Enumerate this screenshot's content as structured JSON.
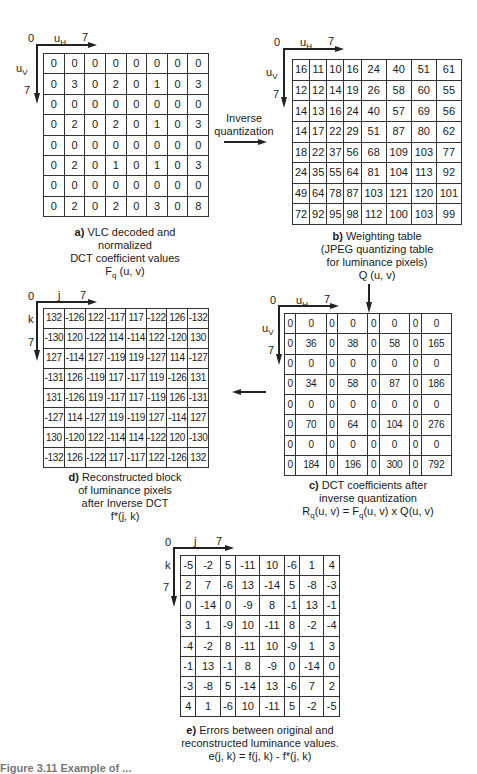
{
  "panels": {
    "a": {
      "axis": {
        "origin": "0",
        "h_label": "u",
        "h_sub": "H",
        "h_max": "7",
        "v_label": "u",
        "v_sub": "V",
        "v_max": "7"
      },
      "caption_label": "a)",
      "caption_lines": [
        "VLC decoded and",
        "normalized",
        "DCT coefficient values",
        "F"
      ],
      "caption_sub": "q",
      "caption_tail": "(u, v)",
      "matrix": [
        [
          "0",
          "0",
          "0",
          "0",
          "0",
          "0",
          "0",
          "0"
        ],
        [
          "0",
          "3",
          "0",
          "2",
          "0",
          "1",
          "0",
          "3"
        ],
        [
          "0",
          "0",
          "0",
          "0",
          "0",
          "0",
          "0",
          "0"
        ],
        [
          "0",
          "2",
          "0",
          "2",
          "0",
          "1",
          "0",
          "3"
        ],
        [
          "0",
          "0",
          "0",
          "0",
          "0",
          "0",
          "0",
          "0"
        ],
        [
          "0",
          "2",
          "0",
          "1",
          "0",
          "1",
          "0",
          "3"
        ],
        [
          "0",
          "0",
          "0",
          "0",
          "0",
          "0",
          "0",
          "0"
        ],
        [
          "0",
          "2",
          "0",
          "2",
          "0",
          "3",
          "0",
          "8"
        ]
      ]
    },
    "b": {
      "axis": {
        "origin": "0",
        "h_label": "u",
        "h_sub": "H",
        "h_max": "7",
        "v_label": "u",
        "v_sub": "V",
        "v_max": "7"
      },
      "caption_label": "b)",
      "caption_lines": [
        "Weighting table",
        "(JPEG quantizing table",
        "for luminance pixels)",
        "Q (u, v)"
      ],
      "matrix": [
        [
          "16",
          "11",
          "10",
          "16",
          "24",
          "40",
          "51",
          "61"
        ],
        [
          "12",
          "12",
          "14",
          "19",
          "26",
          "58",
          "60",
          "55"
        ],
        [
          "14",
          "13",
          "16",
          "24",
          "40",
          "57",
          "69",
          "56"
        ],
        [
          "14",
          "17",
          "22",
          "29",
          "51",
          "87",
          "80",
          "62"
        ],
        [
          "18",
          "22",
          "37",
          "56",
          "68",
          "109",
          "103",
          "77"
        ],
        [
          "24",
          "35",
          "55",
          "64",
          "81",
          "104",
          "113",
          "92"
        ],
        [
          "49",
          "64",
          "78",
          "87",
          "103",
          "121",
          "120",
          "101"
        ],
        [
          "72",
          "92",
          "95",
          "98",
          "112",
          "100",
          "103",
          "99"
        ]
      ]
    },
    "c": {
      "axis": {
        "origin": "0",
        "h_label": "u",
        "h_sub": "H",
        "h_max": "7",
        "v_label": "u",
        "v_sub": "V",
        "v_max": "7"
      },
      "caption_label": "c)",
      "caption_lines": [
        "DCT coefficients after",
        "inverse quantization"
      ],
      "caption_formula": {
        "r": "R",
        "r_sub": "q",
        "mid": "(u, v) = F",
        "f_sub": "q",
        "tail": "(u, v) x Q(u, v)"
      },
      "matrix": [
        [
          "0",
          "0",
          "0",
          "0",
          "0",
          "0",
          "0",
          "0"
        ],
        [
          "0",
          "36",
          "0",
          "38",
          "0",
          "58",
          "0",
          "165"
        ],
        [
          "0",
          "0",
          "0",
          "0",
          "0",
          "0",
          "0",
          "0"
        ],
        [
          "0",
          "34",
          "0",
          "58",
          "0",
          "87",
          "0",
          "186"
        ],
        [
          "0",
          "0",
          "0",
          "0",
          "0",
          "0",
          "0",
          "0"
        ],
        [
          "0",
          "70",
          "0",
          "64",
          "0",
          "104",
          "0",
          "276"
        ],
        [
          "0",
          "0",
          "0",
          "0",
          "0",
          "0",
          "0",
          "0"
        ],
        [
          "0",
          "184",
          "0",
          "196",
          "0",
          "300",
          "0",
          "792"
        ]
      ]
    },
    "d": {
      "axis": {
        "origin": "0",
        "h_label": "j",
        "h_max": "7",
        "v_label": "k",
        "v_max": "7"
      },
      "caption_label": "d)",
      "caption_lines": [
        "Reconstructed block",
        "of luminance pixels",
        "after Inverse DCT",
        "f*(j, k)"
      ],
      "matrix": [
        [
          "132",
          "-126",
          "122",
          "-117",
          "117",
          "-122",
          "126",
          "-132"
        ],
        [
          "-130",
          "120",
          "-122",
          "114",
          "-114",
          "122",
          "-120",
          "130"
        ],
        [
          "127",
          "-114",
          "127",
          "-119",
          "119",
          "-127",
          "114",
          "-127"
        ],
        [
          "-131",
          "126",
          "-119",
          "117",
          "-117",
          "119",
          "-126",
          "131"
        ],
        [
          "131",
          "-126",
          "119",
          "-117",
          "117",
          "-119",
          "126",
          "-131"
        ],
        [
          "-127",
          "114",
          "-127",
          "119",
          "-119",
          "127",
          "-114",
          "127"
        ],
        [
          "130",
          "-120",
          "122",
          "-114",
          "114",
          "-122",
          "120",
          "-130"
        ],
        [
          "-132",
          "126",
          "-122",
          "117",
          "-117",
          "122",
          "-126",
          "132"
        ]
      ]
    },
    "e": {
      "axis": {
        "origin": "0",
        "h_label": "j",
        "h_max": "7",
        "v_label": "k",
        "v_max": "7"
      },
      "caption_label": "e)",
      "caption_lines": [
        "Errors between original and",
        "reconstructed luminance values.",
        "e(j, k) = f(j, k) - f*(j, k)"
      ],
      "matrix": [
        [
          "-5",
          "-2",
          "5",
          "-11",
          "10",
          "-6",
          "1",
          "4"
        ],
        [
          "2",
          "7",
          "-6",
          "13",
          "-14",
          "5",
          "-8",
          "-3"
        ],
        [
          "0",
          "-14",
          "0",
          "-9",
          "8",
          "-1",
          "13",
          "-1"
        ],
        [
          "3",
          "1",
          "-9",
          "10",
          "-11",
          "8",
          "-2",
          "-4"
        ],
        [
          "-4",
          "-2",
          "8",
          "-11",
          "10",
          "-9",
          "1",
          "3"
        ],
        [
          "-1",
          "13",
          "-1",
          "8",
          "-9",
          "0",
          "-14",
          "0"
        ],
        [
          "-3",
          "-8",
          "5",
          "-14",
          "13",
          "-6",
          "7",
          "2"
        ],
        [
          "4",
          "1",
          "-6",
          "10",
          "-11",
          "5",
          "-2",
          "-5"
        ]
      ]
    }
  },
  "flow": {
    "inverse_quantization_line1": "Inverse",
    "inverse_quantization_line2": "quantization"
  },
  "figure_caption": "Figure 3.11  Example of ..."
}
